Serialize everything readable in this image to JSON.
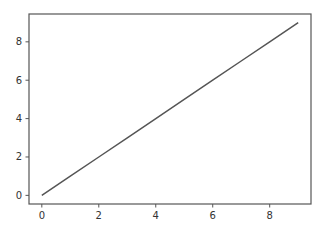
{
  "chart_data": {
    "type": "line",
    "title": "",
    "xlabel": "",
    "ylabel": "",
    "x": [
      0,
      1,
      2,
      3,
      4,
      5,
      6,
      7,
      8,
      9
    ],
    "series": [
      {
        "name": "line",
        "values": [
          0,
          1,
          2,
          3,
          4,
          5,
          6,
          7,
          8,
          9
        ],
        "color": "#555555"
      }
    ],
    "xlim": [
      -0.45,
      9.45
    ],
    "ylim": [
      -0.45,
      9.45
    ],
    "xticks": [
      0,
      2,
      4,
      6,
      8
    ],
    "yticks": [
      0,
      2,
      4,
      6,
      8
    ],
    "grid": false,
    "legend": null
  },
  "axes": {
    "xtick_labels": [
      "0",
      "2",
      "4",
      "6",
      "8"
    ],
    "ytick_labels": [
      "0",
      "2",
      "4",
      "6",
      "8"
    ]
  }
}
